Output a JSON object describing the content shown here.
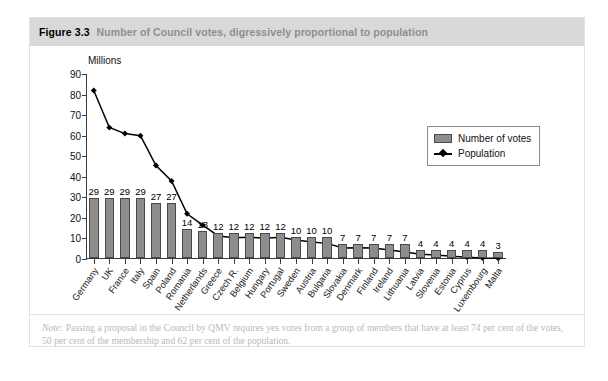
{
  "figure": {
    "number": "Figure 3.3",
    "caption": "Number of Council votes, digressively proportional to population",
    "note_prefix": "Note:",
    "note_text": " Passing a proposal in the Council by QMV requires yes votes from a group of members that have at least 74 per cent of the votes, 50 per cent of the membership and 62 per cent of the population."
  },
  "legend": {
    "position": "top-right",
    "entries": [
      {
        "label": "Number of votes",
        "marker": "bar-swatch",
        "color": "#8d8d8d"
      },
      {
        "label": "Population",
        "marker": "line-diamond",
        "color": "#000000"
      }
    ]
  },
  "chart_data": {
    "type": "bar",
    "title": "Number of Council votes, digressively proportional to population",
    "xlabel": "",
    "ylabel": "Millions",
    "ylim": [
      0,
      90
    ],
    "yticks": [
      0,
      10,
      20,
      30,
      40,
      50,
      60,
      70,
      80,
      90
    ],
    "grid": false,
    "categories": [
      "Germany",
      "UK",
      "France",
      "Italy",
      "Spain",
      "Poland",
      "Romania",
      "Netherlands",
      "Greece",
      "Czech R.",
      "Belgium",
      "Hungary",
      "Portugal",
      "Sweden",
      "Austria",
      "Bulgaria",
      "Slovakia",
      "Denmark",
      "Finland",
      "Ireland",
      "Lithuania",
      "Latvia",
      "Slovenia",
      "Estonia",
      "Cyprus",
      "Luxembourg",
      "Malta"
    ],
    "series": [
      {
        "name": "Number of votes",
        "type": "bar",
        "color": "#8d8d8d",
        "labels_shown": true,
        "values": [
          29,
          29,
          29,
          29,
          27,
          27,
          14,
          13,
          12,
          12,
          12,
          12,
          12,
          10,
          10,
          10,
          7,
          7,
          7,
          7,
          7,
          4,
          4,
          4,
          4,
          4,
          3
        ]
      },
      {
        "name": "Population",
        "type": "line",
        "color": "#000000",
        "marker": "diamond",
        "labels_shown": false,
        "values": [
          82,
          64,
          61,
          60,
          45.5,
          38,
          22,
          16.5,
          11.2,
          10.3,
          10.6,
          10.1,
          10.6,
          9.2,
          8.3,
          7.6,
          5.4,
          5.5,
          5.3,
          4.4,
          3.4,
          2.3,
          2.0,
          1.3,
          0.8,
          0.5,
          0.4
        ]
      }
    ]
  }
}
